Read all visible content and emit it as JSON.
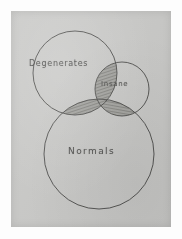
{
  "image": {
    "kind": "scanned-hand-drawn-venn-diagram",
    "paper_color": "#c9c9c7",
    "ink_color": "#3a3a38",
    "scan_margin_color": "#fdfdfd"
  },
  "diagram": {
    "type": "venn",
    "set_count": 3,
    "sets": [
      {
        "id": "degenerates",
        "label": "Degenerates",
        "cx": 64,
        "cy": 62,
        "r": 42,
        "label_x": 18,
        "label_y": 48
      },
      {
        "id": "insane",
        "label": "Insane",
        "cx": 111,
        "cy": 78,
        "r": 27,
        "label_x": 90,
        "label_y": 69
      },
      {
        "id": "normals",
        "label": "Normals",
        "cx": 88,
        "cy": 143,
        "r": 55,
        "label_x": 57,
        "label_y": 135
      }
    ],
    "intersections": [
      {
        "id": "degenerates-normals",
        "sets": [
          "degenerates",
          "normals"
        ],
        "shading": "hatched",
        "shade_color": "#8d8d89"
      },
      {
        "id": "degenerates-insane",
        "sets": [
          "degenerates",
          "insane"
        ],
        "shading": "hatched",
        "shade_color": "#8d8d89"
      },
      {
        "id": "insane-normals",
        "sets": [
          "insane",
          "normals"
        ],
        "shading": "hatched",
        "shade_color": "#8d8d89"
      }
    ]
  }
}
